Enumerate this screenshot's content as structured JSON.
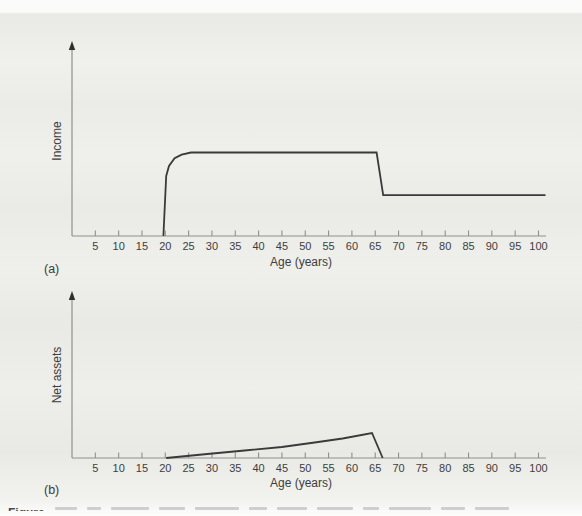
{
  "figure": {
    "panel_a_label": "(a)",
    "panel_b_label": "(b)",
    "caption_fragment": "Figure"
  },
  "colors": {
    "line": "#3a3a3a",
    "axis": "#8f8f8f",
    "tick_text": "#3d3d3d"
  },
  "chart_data": [
    {
      "id": "a",
      "type": "line",
      "panel": "(a)",
      "title": "",
      "xlabel": "Age (years)",
      "ylabel": "Income",
      "x_ticks": [
        5,
        10,
        15,
        20,
        25,
        30,
        35,
        40,
        45,
        50,
        55,
        60,
        65,
        70,
        75,
        80,
        85,
        90,
        95,
        100
      ],
      "xlim": [
        0,
        102
      ],
      "ylim": [
        0,
        1.4
      ],
      "grid": false,
      "legend": null,
      "series": [
        {
          "name": "income-profile",
          "points": [
            [
              19.6,
              0
            ],
            [
              20.2,
              0.72
            ],
            [
              20.8,
              0.84
            ],
            [
              22,
              0.93
            ],
            [
              23.5,
              0.975
            ],
            [
              25.5,
              1.0
            ],
            [
              65.3,
              1.0
            ],
            [
              66.7,
              0.49
            ],
            [
              101.5,
              0.49
            ]
          ]
        }
      ]
    },
    {
      "id": "b",
      "type": "line",
      "panel": "(b)",
      "title": "",
      "xlabel": "Age (years)",
      "ylabel": "Net assets",
      "x_ticks": [
        5,
        10,
        15,
        20,
        25,
        30,
        35,
        40,
        45,
        50,
        55,
        60,
        65,
        70,
        75,
        80,
        85,
        90,
        95,
        100
      ],
      "xlim": [
        0,
        102
      ],
      "ylim": [
        0,
        1.2
      ],
      "grid": false,
      "legend": null,
      "series": [
        {
          "name": "net-assets-profile",
          "points": [
            [
              20.2,
              0
            ],
            [
              29,
              0.16
            ],
            [
              37,
              0.3
            ],
            [
              45,
              0.44
            ],
            [
              52,
              0.62
            ],
            [
              58,
              0.78
            ],
            [
              64.3,
              1.0
            ],
            [
              66.6,
              0
            ]
          ]
        }
      ]
    }
  ]
}
